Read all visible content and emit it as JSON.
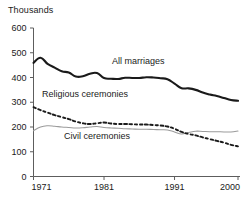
{
  "chart_data": {
    "type": "line",
    "title": "",
    "unit_label": "Thousands",
    "xlabel": "",
    "ylabel": "Thousands",
    "grid": false,
    "legend_position": "inline-annotations",
    "xlim": [
      1971,
      2000
    ],
    "ylim": [
      0,
      600
    ],
    "ytick_labels": [
      "0",
      "100",
      "200",
      "300",
      "400",
      "500",
      "600"
    ],
    "yticks": [
      0,
      100,
      200,
      300,
      400,
      500,
      600
    ],
    "xtick_labels": [
      "1971",
      "1981",
      "1991",
      "2000"
    ],
    "xticks": [
      1971,
      1981,
      1991,
      2000
    ],
    "x": [
      1971,
      1972,
      1973,
      1974,
      1975,
      1976,
      1977,
      1978,
      1979,
      1980,
      1981,
      1982,
      1983,
      1984,
      1985,
      1986,
      1987,
      1988,
      1989,
      1990,
      1991,
      1992,
      1993,
      1994,
      1995,
      1996,
      1997,
      1998,
      1999,
      2000
    ],
    "series": [
      {
        "name": "All marriages",
        "style": "solid-thick",
        "color": "#1a1a1a",
        "values": [
          459,
          480,
          455,
          440,
          425,
          420,
          404,
          405,
          415,
          418,
          398,
          395,
          394,
          399,
          398,
          398,
          401,
          400,
          397,
          393,
          375,
          357,
          356,
          350,
          339,
          331,
          325,
          317,
          309,
          306
        ]
      },
      {
        "name": "Religious ceremonies",
        "style": "dashed",
        "color": "#1a1a1a",
        "values": [
          280,
          268,
          258,
          248,
          240,
          232,
          222,
          215,
          212,
          215,
          218,
          214,
          212,
          212,
          211,
          210,
          210,
          208,
          206,
          202,
          193,
          180,
          172,
          166,
          158,
          151,
          144,
          137,
          128,
          122
        ]
      },
      {
        "name": "Civil ceremonies",
        "style": "solid-thin",
        "color": "#9b9b9b",
        "values": [
          185,
          200,
          205,
          203,
          200,
          198,
          196,
          197,
          200,
          202,
          198,
          196,
          195,
          193,
          192,
          191,
          191,
          190,
          189,
          188,
          180,
          172,
          178,
          183,
          182,
          181,
          181,
          180,
          180,
          184
        ]
      }
    ],
    "annotations": [
      {
        "text": "All marriages",
        "x_px": 112,
        "y_px": 64
      },
      {
        "text": "Religious ceremonies",
        "x_px": 42,
        "y_px": 97
      },
      {
        "text": "Civil ceremonies",
        "x_px": 64,
        "y_px": 139
      }
    ]
  }
}
